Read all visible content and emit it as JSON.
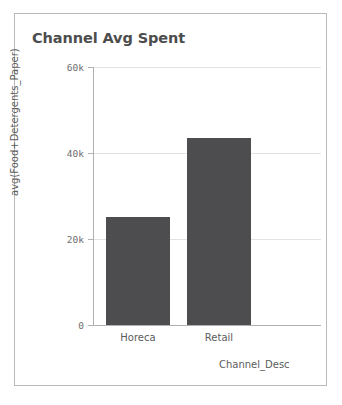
{
  "card": {
    "title": "Channel Avg Spent",
    "border_color": "#b9b9b9",
    "background": "#ffffff"
  },
  "chart_data": {
    "type": "bar",
    "title": "Channel Avg Spent",
    "xlabel": "Channel_Desc",
    "ylabel": "avg(Food+Detergents_Paper)",
    "categories": [
      "Horeca",
      "Retail"
    ],
    "values": [
      25100,
      43600
    ],
    "series": [
      {
        "name": "avg(Food+Detergents_Paper)",
        "values": [
          25100,
          43600
        ]
      }
    ],
    "ylim": [
      0,
      60000
    ],
    "yticks": [
      0,
      20000,
      40000,
      60000
    ],
    "ytick_labels": [
      "0",
      "20k",
      "40k",
      "60k"
    ],
    "grid": true,
    "grid_axis": "y",
    "legend": false,
    "bar_color": "#4d4d50",
    "grid_color": "#e3e3e3",
    "axis_color": "#b0b0b0",
    "title_color": "#4d4d4d",
    "label_color": "#5c5c5c"
  },
  "axis": {
    "y_title": "avg(Food+Detergents_Paper)",
    "x_title": "Channel_Desc",
    "y_labels": {
      "t60k": "60k",
      "t40k": "40k",
      "t20k": "20k",
      "t0": "0"
    },
    "x_labels": {
      "horeca": "Horeca",
      "retail": "Retail"
    }
  }
}
